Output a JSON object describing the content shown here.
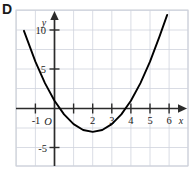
{
  "panel": {
    "letter": "D"
  },
  "chart_data": {
    "type": "line",
    "title": "",
    "subtitle": "",
    "xlabel": "x",
    "ylabel": "y",
    "xlim": [
      -2,
      7
    ],
    "ylim": [
      -7,
      13
    ],
    "grid": true,
    "grid_step_x": 1,
    "grid_step_y": 2.5,
    "legend": "none",
    "x_tick_labels": [
      "-1",
      "2",
      "3",
      "4",
      "5",
      "6"
    ],
    "x_tick_values": [
      -1,
      2,
      3,
      4,
      5,
      6
    ],
    "y_tick_labels": [
      "10",
      "5",
      "-5"
    ],
    "y_tick_values": [
      10,
      5,
      -5
    ],
    "origin_label": "O",
    "curve": {
      "name": "parabola",
      "equation": "y = x^2 - 4x + 1",
      "shape": "upward parabola",
      "vertex": [
        2,
        -3
      ],
      "roots": [
        0.27,
        3.73
      ],
      "y_intercept": 1,
      "points": [
        {
          "x": -1.6,
          "y": 9.96
        },
        {
          "x": -1.0,
          "y": 6.0
        },
        {
          "x": -0.5,
          "y": 3.25
        },
        {
          "x": 0.0,
          "y": 1.0
        },
        {
          "x": 0.5,
          "y": -0.75
        },
        {
          "x": 1.0,
          "y": -2.0
        },
        {
          "x": 1.5,
          "y": -2.75
        },
        {
          "x": 2.0,
          "y": -3.0
        },
        {
          "x": 2.5,
          "y": -2.75
        },
        {
          "x": 3.0,
          "y": -2.0
        },
        {
          "x": 3.5,
          "y": -0.75
        },
        {
          "x": 4.0,
          "y": 1.0
        },
        {
          "x": 4.5,
          "y": 3.25
        },
        {
          "x": 5.0,
          "y": 6.0
        },
        {
          "x": 5.5,
          "y": 9.25
        },
        {
          "x": 5.9,
          "y": 12.0
        }
      ]
    },
    "colors": {
      "curve": "#000000",
      "axis": "#2b2b2b",
      "grid": "#cfd3dd",
      "frame": "#b9bec9",
      "text": "#1a1a1a"
    }
  }
}
